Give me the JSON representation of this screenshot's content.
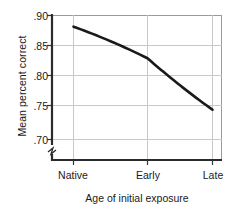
{
  "chart_data": {
    "type": "line",
    "title": "",
    "xlabel": "Age of initial exposure",
    "ylabel": "Mean percent correct",
    "categories": [
      "Native",
      "Early",
      "Late"
    ],
    "values": [
      0.882,
      0.831,
      0.748
    ],
    "series": [
      {
        "name": "Mean percent correct",
        "values": [
          0.882,
          0.831,
          0.748
        ]
      }
    ],
    "ytick_labels": [
      ".90",
      ".85",
      ".80",
      ".75",
      ".70"
    ],
    "ytick_values": [
      0.9,
      0.85,
      0.8,
      0.75,
      0.7
    ],
    "ylim": [
      0.7,
      0.9
    ],
    "xlim": [
      0,
      2
    ],
    "grid": true,
    "axis_break": true,
    "legend": "none",
    "line_color": "#1a1a1a",
    "grid_color": "#c8c8c8",
    "axis_color": "#333333"
  },
  "axes": {
    "y_title": "Mean percent correct",
    "x_title": "Age of initial exposure"
  }
}
